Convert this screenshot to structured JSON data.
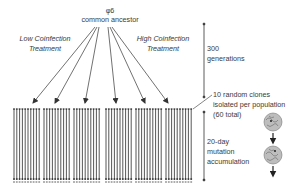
{
  "ancestor": {
    "symbol": "φ6",
    "label": "common ancestor"
  },
  "treatments": {
    "low": {
      "line1": "Low Coinfection",
      "line2": "Treatment"
    },
    "high": {
      "line1": "High Coinfection",
      "line2": "Treatment"
    }
  },
  "timeline": {
    "generations": {
      "line1": "300",
      "line2": "generations"
    },
    "clones": {
      "line1": "10 random clones",
      "line2": "isolated per population",
      "line3": "(60 total)"
    },
    "mutation": {
      "line1": "20-day",
      "line2": "mutation",
      "line3": "accumulation"
    }
  },
  "populations": {
    "count": 6,
    "clones_per_population": 10
  },
  "colors": {
    "line": "#333333",
    "text": "#3a3a3a",
    "plaque": "#9a9a9a"
  }
}
